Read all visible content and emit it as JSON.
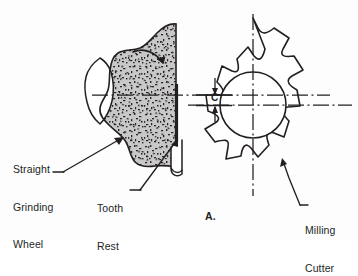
{
  "figure": {
    "caption": "A.",
    "background_color": "#fdfdfd",
    "line_color": "#231f1f",
    "wheel_fill_color": "#c8c8c8",
    "speckle_color": "#2b2626"
  },
  "labels": {
    "grinding_wheel": {
      "line1": "Straight",
      "line2": "Grinding",
      "line3": "Wheel",
      "target": "grinding-wheel"
    },
    "tooth_rest": {
      "line1": "Tooth",
      "line2": "Rest",
      "target": "tooth-rest"
    },
    "milling_cutter": {
      "line1": "Milling",
      "line2": "Cutter",
      "target": "milling-cutter"
    },
    "dimension_c": {
      "text": "C",
      "meaning": "offset between grinding wheel centerline and milling cutter centerline"
    }
  },
  "parts": {
    "grinding_wheel": {
      "name": "Straight Grinding Wheel",
      "view": "half-section",
      "center_x": 168,
      "center_y": 95,
      "radius": 72,
      "rotation_arrow": "clockwise"
    },
    "milling_cutter": {
      "name": "Milling Cutter",
      "center_x": 253,
      "center_y": 105,
      "tooth_count": 12,
      "outer_radius": 88,
      "root_radius": 64,
      "bore_radius": 33
    },
    "tooth_rest": {
      "name": "Tooth Rest",
      "blade_x": 176,
      "blade_top_y": 84,
      "blade_bottom_y": 178
    }
  },
  "centerlines": {
    "wheel_horizontal": {
      "y": 95,
      "x_start": 92,
      "x_end": 330,
      "style": "dash-dot"
    },
    "cutter_horizontal": {
      "y": 105,
      "x_start": 188,
      "x_end": 350,
      "style": "dash-dot"
    },
    "cutter_vertical": {
      "x": 253,
      "y_start": 14,
      "y_end": 196,
      "style": "dash-dot"
    }
  }
}
